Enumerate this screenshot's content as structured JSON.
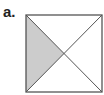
{
  "figure": {
    "label": "a.",
    "shape": "square",
    "diagonals": 2,
    "shaded_region": "left triangle",
    "colors": {
      "stroke": "#555555",
      "shade": "#cccccc",
      "background": "#ffffff"
    }
  }
}
